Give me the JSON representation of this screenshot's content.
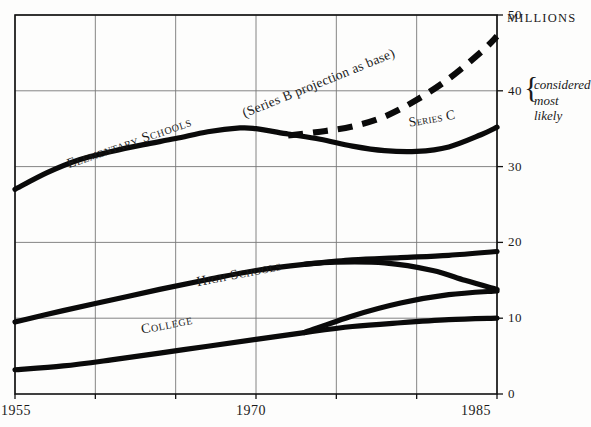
{
  "chart_data": {
    "type": "line",
    "title": "",
    "subtitle": "",
    "xlabel": "",
    "ylabel": "",
    "unit_label": "MILLIONS",
    "xlim": [
      1955,
      1985
    ],
    "ylim": [
      0,
      50
    ],
    "x_ticks": [
      1955,
      1970,
      1985
    ],
    "x_gridlines": [
      1955,
      1960,
      1965,
      1970,
      1975,
      1980,
      1985
    ],
    "y_ticks": [
      0,
      10,
      20,
      30,
      40,
      50
    ],
    "grid": true,
    "legend": "inline-labels",
    "annotations": [
      {
        "name": "projection-note",
        "text": "(Series B projection as base)",
        "x": 1974,
        "y": 40.5,
        "rotate": -22
      },
      {
        "name": "series-c-note",
        "text": "Series C",
        "x": 1981,
        "y": 35.8,
        "rotate": -10
      },
      {
        "name": "considered-most-likely-line1",
        "text": "considered",
        "x": 1986,
        "y": 40.5
      },
      {
        "name": "considered-most-likely-line2",
        "text": "most likely",
        "x": 1986,
        "y": 38.6
      }
    ],
    "series": [
      {
        "name": "Elementary Schools",
        "label": "Elementary Schools",
        "label_x": 1962.2,
        "label_y": 32.6,
        "label_rotate": -19,
        "style": "solid",
        "points": [
          [
            1955,
            27.0
          ],
          [
            1957,
            29.2
          ],
          [
            1959,
            30.9
          ],
          [
            1961,
            32.0
          ],
          [
            1963,
            32.9
          ],
          [
            1965,
            33.7
          ],
          [
            1967,
            34.6
          ],
          [
            1969,
            35.1
          ],
          [
            1970,
            35.0
          ],
          [
            1972,
            34.3
          ],
          [
            1974,
            33.6
          ],
          [
            1976,
            32.7
          ],
          [
            1978,
            32.1
          ],
          [
            1980,
            32.0
          ],
          [
            1982,
            32.6
          ],
          [
            1984,
            34.2
          ],
          [
            1985,
            35.2
          ]
        ]
      },
      {
        "name": "Elementary Schools Series B projection",
        "label": "",
        "style": "dashed",
        "points": [
          [
            1972,
            34.1
          ],
          [
            1974,
            34.6
          ],
          [
            1976,
            35.3
          ],
          [
            1978,
            36.6
          ],
          [
            1980,
            38.8
          ],
          [
            1982,
            41.6
          ],
          [
            1984,
            45.1
          ],
          [
            1985,
            47.2
          ]
        ]
      },
      {
        "name": "High Schools",
        "label": "High Schools",
        "label_x": 1969.0,
        "label_y": 15.3,
        "label_rotate": -11,
        "style": "solid",
        "points": [
          [
            1955,
            9.5
          ],
          [
            1958,
            11.0
          ],
          [
            1961,
            12.4
          ],
          [
            1964,
            13.8
          ],
          [
            1967,
            15.1
          ],
          [
            1970,
            16.3
          ],
          [
            1973,
            17.1
          ],
          [
            1975,
            17.4
          ],
          [
            1978,
            17.3
          ],
          [
            1981,
            16.3
          ],
          [
            1983,
            15.0
          ],
          [
            1985,
            13.8
          ]
        ]
      },
      {
        "name": "High Schools upper branch",
        "label": "",
        "style": "solid",
        "points": [
          [
            1973,
            17.1
          ],
          [
            1976,
            17.7
          ],
          [
            1979,
            18.0
          ],
          [
            1982,
            18.3
          ],
          [
            1985,
            18.8
          ]
        ]
      },
      {
        "name": "College",
        "label": "College",
        "label_x": 1964.5,
        "label_y": 8.6,
        "label_rotate": -11,
        "style": "solid",
        "points": [
          [
            1955,
            3.2
          ],
          [
            1958,
            3.7
          ],
          [
            1961,
            4.5
          ],
          [
            1964,
            5.4
          ],
          [
            1967,
            6.3
          ],
          [
            1970,
            7.2
          ],
          [
            1973,
            8.1
          ],
          [
            1976,
            8.9
          ],
          [
            1979,
            9.4
          ],
          [
            1982,
            9.8
          ],
          [
            1985,
            10.0
          ]
        ]
      },
      {
        "name": "College upper branch",
        "label": "",
        "style": "solid",
        "points": [
          [
            1973,
            8.1
          ],
          [
            1976,
            10.3
          ],
          [
            1979,
            12.0
          ],
          [
            1982,
            13.1
          ],
          [
            1985,
            13.6
          ]
        ]
      }
    ]
  },
  "axis": {
    "y_tick_labels": [
      "0",
      "10",
      "20",
      "30",
      "40",
      "50"
    ],
    "x_tick_labels": [
      "1955",
      "1970",
      "1985"
    ],
    "unit": "MILLIONS"
  },
  "note": {
    "brace": "{",
    "line1": "considered",
    "line2": "most likely",
    "anchor_value": "40"
  }
}
